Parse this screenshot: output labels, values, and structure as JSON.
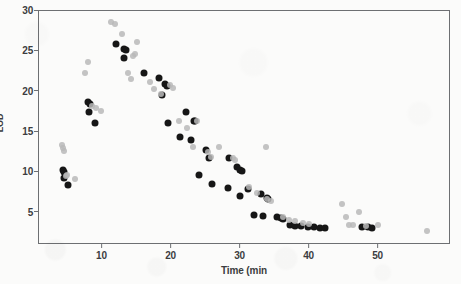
{
  "chart_data": {
    "type": "scatter",
    "title": "",
    "xlabel": "Time (min",
    "ylabel": "LOD",
    "xlim": [
      0.8,
      60.5
    ],
    "ylim": [
      1.0,
      30.0
    ],
    "xticks": [
      10,
      20,
      30,
      40,
      50
    ],
    "yticks": [
      5,
      10,
      15,
      20,
      25,
      30
    ],
    "grid": false,
    "legend": null,
    "series": [
      {
        "name": "dark",
        "color": "#161616",
        "marker": "circle",
        "points": [
          [
            4.4,
            10.2
          ],
          [
            4.5,
            9.9
          ],
          [
            4.6,
            9.2
          ],
          [
            5.2,
            8.3
          ],
          [
            8.0,
            18.6
          ],
          [
            8.4,
            18.4
          ],
          [
            8.2,
            17.3
          ],
          [
            9.1,
            16.0
          ],
          [
            12.1,
            25.8
          ],
          [
            13.3,
            25.2
          ],
          [
            13.5,
            25.1
          ],
          [
            13.2,
            24.0
          ],
          [
            16.2,
            22.2
          ],
          [
            18.3,
            21.6
          ],
          [
            19.2,
            20.8
          ],
          [
            19.5,
            20.6
          ],
          [
            18.7,
            19.5
          ],
          [
            19.6,
            16.0
          ],
          [
            22.3,
            17.4
          ],
          [
            23.4,
            16.3
          ],
          [
            23.6,
            16.2
          ],
          [
            23.0,
            13.9
          ],
          [
            25.1,
            12.6
          ],
          [
            25.6,
            11.7
          ],
          [
            24.1,
            9.6
          ],
          [
            26.0,
            8.4
          ],
          [
            21.4,
            14.2
          ],
          [
            28.5,
            11.6
          ],
          [
            29.6,
            10.5
          ],
          [
            30.0,
            10.2
          ],
          [
            30.3,
            10.0
          ],
          [
            28.3,
            7.9
          ],
          [
            30.0,
            6.9
          ],
          [
            31.2,
            7.8
          ],
          [
            32.1,
            4.6
          ],
          [
            33.1,
            7.2
          ],
          [
            34.0,
            6.7
          ],
          [
            34.2,
            6.6
          ],
          [
            33.4,
            4.5
          ],
          [
            35.5,
            4.3
          ],
          [
            36.0,
            4.2
          ],
          [
            36.3,
            4.1
          ],
          [
            37.3,
            3.3
          ],
          [
            38.1,
            3.2
          ],
          [
            38.9,
            3.2
          ],
          [
            39.9,
            3.1
          ],
          [
            40.8,
            3.1
          ],
          [
            41.7,
            3.0
          ],
          [
            42.4,
            3.0
          ],
          [
            47.8,
            3.1
          ],
          [
            48.6,
            3.1
          ],
          [
            49.2,
            3.0
          ]
        ]
      },
      {
        "name": "light",
        "color": "#b9b9b9",
        "marker": "circle",
        "points": [
          [
            4.3,
            13.3
          ],
          [
            4.4,
            12.9
          ],
          [
            4.5,
            12.5
          ],
          [
            5.0,
            9.6
          ],
          [
            6.2,
            9.1
          ],
          [
            4.8,
            9.4
          ],
          [
            7.6,
            22.2
          ],
          [
            8.0,
            23.5
          ],
          [
            8.6,
            18.1
          ],
          [
            9.2,
            17.9
          ],
          [
            10.0,
            17.5
          ],
          [
            11.4,
            28.5
          ],
          [
            12.0,
            28.3
          ],
          [
            12.9,
            27.0
          ],
          [
            14.9,
            24.6
          ],
          [
            14.6,
            24.3
          ],
          [
            15.2,
            26.0
          ],
          [
            13.9,
            22.2
          ],
          [
            14.3,
            21.5
          ],
          [
            17.0,
            21.1
          ],
          [
            17.6,
            20.2
          ],
          [
            18.6,
            19.6
          ],
          [
            19.9,
            20.7
          ],
          [
            20.4,
            20.3
          ],
          [
            21.2,
            16.3
          ],
          [
            22.4,
            15.4
          ],
          [
            23.9,
            16.2
          ],
          [
            25.5,
            12.4
          ],
          [
            25.9,
            11.8
          ],
          [
            23.2,
            13.0
          ],
          [
            27.0,
            13.0
          ],
          [
            29.1,
            11.7
          ],
          [
            29.4,
            11.4
          ],
          [
            31.4,
            8.1
          ],
          [
            32.5,
            7.3
          ],
          [
            34.0,
            6.6
          ],
          [
            34.6,
            6.3
          ],
          [
            33.9,
            13.0
          ],
          [
            36.3,
            4.3
          ],
          [
            37.1,
            4.0
          ],
          [
            38.0,
            3.8
          ],
          [
            39.2,
            3.6
          ],
          [
            40.0,
            3.5
          ],
          [
            44.8,
            5.9
          ],
          [
            45.5,
            4.3
          ],
          [
            45.9,
            3.4
          ],
          [
            46.4,
            3.3
          ],
          [
            47.3,
            5.0
          ],
          [
            48.4,
            3.2
          ],
          [
            50.1,
            3.3
          ],
          [
            57.2,
            2.6
          ]
        ]
      }
    ]
  }
}
